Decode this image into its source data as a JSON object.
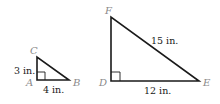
{
  "diagram": {
    "type": "similar-right-triangles",
    "small_triangle": {
      "vertices": {
        "right_angle": "A",
        "top": "C",
        "right": "B"
      },
      "sides": {
        "AC": "3 in.",
        "AB": "4 in."
      }
    },
    "large_triangle": {
      "vertices": {
        "right_angle": "D",
        "top": "F",
        "right": "E"
      },
      "sides": {
        "FE": "15 in.",
        "DE": "12 in."
      }
    },
    "colors": {
      "line": "#1a1a1a",
      "vertex_label": "#8a8a8a",
      "measure_label": "#1a1a1a"
    }
  }
}
